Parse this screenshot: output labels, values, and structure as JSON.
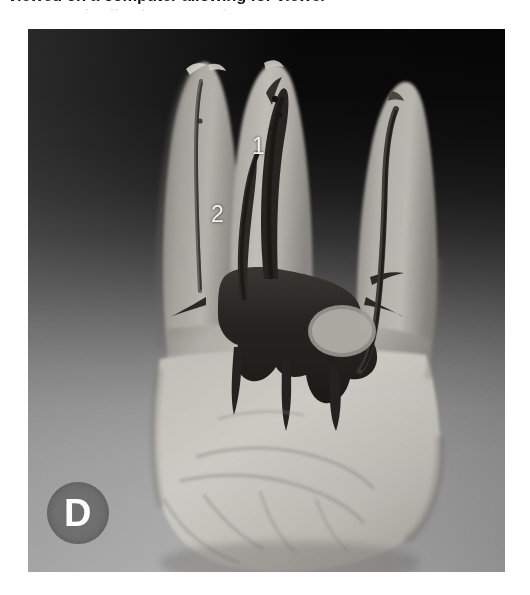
{
  "figure": {
    "caption_line_1": "viewed on a computer allowing for viewer",
    "caption_line_2": "standardized root canal anatomy",
    "panel_letter": "D",
    "panel_letter_badge_color": "#6f6f6f",
    "panel_letter_text_color": "#ffffff"
  },
  "image": {
    "alt": "Micro-CT volumetric rendering of an extracted multi-rooted molar showing the internal root canal system",
    "background_top_color": "#070707",
    "background_bottom_color": "#b0b0b0",
    "tooth_color": "#b9b6b0",
    "canal_color": "#2a2724",
    "width": 477,
    "height": 543
  },
  "annotations": [
    {
      "id": "marker-1",
      "label": "1",
      "x": 224,
      "y": 106,
      "color": "#f2f2f2"
    },
    {
      "id": "marker-2",
      "label": "2",
      "x": 183,
      "y": 174,
      "color": "#f2f2f2"
    }
  ]
}
